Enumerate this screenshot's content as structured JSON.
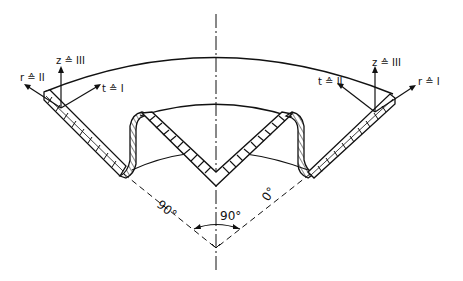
{
  "figure": {
    "colors": {
      "line": "#111111",
      "background": "#ffffff"
    }
  },
  "left_axes": {
    "z_label": "z ≙ III",
    "r_label": "r ≙ II",
    "t_label": "t ≙ I"
  },
  "right_axes": {
    "z_label": "z ≙ III",
    "t_label": "t ≙ II",
    "r_label": "r ≙ I"
  },
  "angles": {
    "left_ray": "90°",
    "right_ray": "0°",
    "included": "90°"
  }
}
